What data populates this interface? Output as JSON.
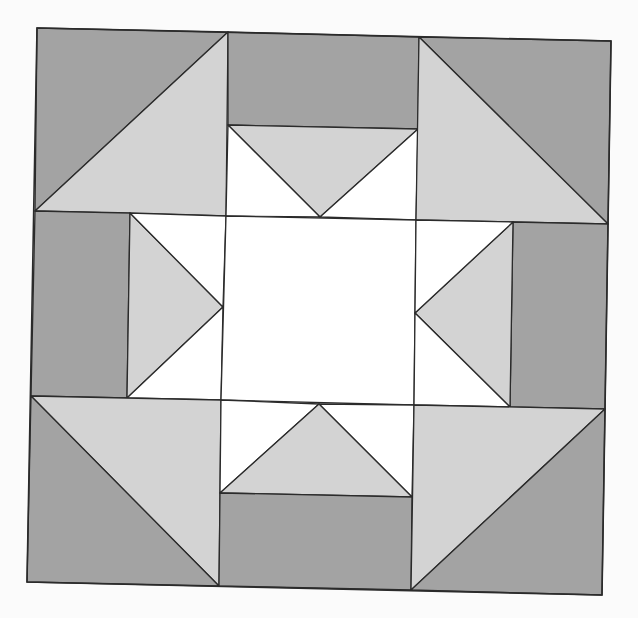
{
  "diagram": {
    "colors": {
      "background": "#fbfbfb",
      "dark": "#a3a3a3",
      "light": "#d3d3d3",
      "white": "#ffffff",
      "stroke": "#2b2b2b"
    },
    "pieces": [
      {
        "name": "corner-tl-dark",
        "fill": "dark",
        "points": "37,28 228,32 35,211"
      },
      {
        "name": "corner-tl-light",
        "fill": "light",
        "points": "228,32 226,216 35,211"
      },
      {
        "name": "top-edge-dark",
        "fill": "dark",
        "points": "228,32 419,37 418,129 228,125"
      },
      {
        "name": "top-center-light",
        "fill": "light",
        "points": "228,125 418,129 320,217"
      },
      {
        "name": "top-center-white-left",
        "fill": "white",
        "points": "228,125 320,217 226,216"
      },
      {
        "name": "top-center-white-right",
        "fill": "white",
        "points": "418,129 416,220 320,217"
      },
      {
        "name": "corner-tr-dark",
        "fill": "dark",
        "points": "419,37 611,41 608,224"
      },
      {
        "name": "corner-tr-light",
        "fill": "light",
        "points": "419,37 608,224 416,220"
      },
      {
        "name": "left-edge-dark",
        "fill": "dark",
        "points": "35,211 130,213 127,398 31,396"
      },
      {
        "name": "left-center-light",
        "fill": "light",
        "points": "130,213 223,307 127,398"
      },
      {
        "name": "left-center-white-top",
        "fill": "white",
        "points": "130,213 226,216 223,307"
      },
      {
        "name": "left-center-white-bottom",
        "fill": "white",
        "points": "223,307 221,400 127,398"
      },
      {
        "name": "center-square",
        "fill": "white",
        "points": "226,216 416,220 414,405 221,400"
      },
      {
        "name": "right-edge-dark",
        "fill": "dark",
        "points": "513,222 608,224 605,409 510,407"
      },
      {
        "name": "right-center-light",
        "fill": "light",
        "points": "513,222 510,407 415,313"
      },
      {
        "name": "right-center-white-top",
        "fill": "white",
        "points": "416,220 513,222 415,313"
      },
      {
        "name": "right-center-white-bottom",
        "fill": "white",
        "points": "415,313 510,407 414,405"
      },
      {
        "name": "corner-bl-light",
        "fill": "light",
        "points": "31,396 221,400 219,586"
      },
      {
        "name": "corner-bl-dark",
        "fill": "dark",
        "points": "31,396 219,586 27,582"
      },
      {
        "name": "bottom-center-white-left",
        "fill": "white",
        "points": "221,400 319,404 220,493"
      },
      {
        "name": "bottom-center-white-right",
        "fill": "white",
        "points": "319,404 414,405 412,497"
      },
      {
        "name": "bottom-center-light",
        "fill": "light",
        "points": "319,404 412,497 220,493"
      },
      {
        "name": "bottom-edge-dark",
        "fill": "dark",
        "points": "220,493 412,497 411,590 219,586"
      },
      {
        "name": "corner-br-light",
        "fill": "light",
        "points": "414,405 605,409 411,590"
      },
      {
        "name": "corner-br-dark",
        "fill": "dark",
        "points": "605,409 602,595 411,590"
      }
    ]
  }
}
